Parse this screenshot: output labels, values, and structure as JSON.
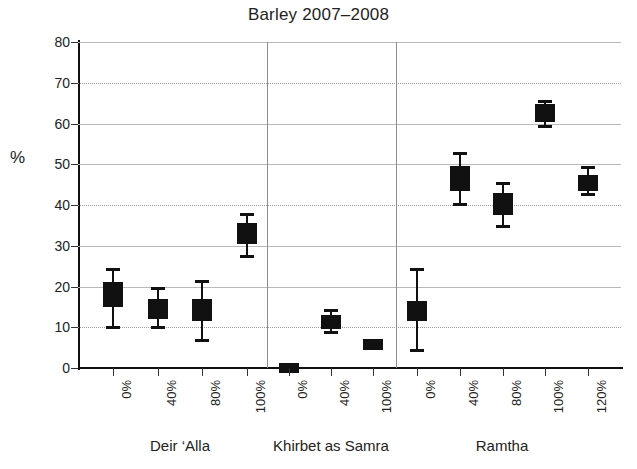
{
  "chart_data": {
    "type": "scatter",
    "title": "Barley 2007–2008",
    "xlabel": "",
    "ylabel": "%",
    "ylim": [
      0,
      80
    ],
    "ytick_step": 10,
    "yticks": [
      "80",
      "70",
      "60",
      "50",
      "40",
      "30",
      "20",
      "10",
      "0"
    ],
    "grid": true,
    "legend": "none",
    "groups": [
      {
        "name": "Deir ‘Alla",
        "categories": [
          "0%",
          "40%",
          "80%",
          "100%"
        ]
      },
      {
        "name": "Khirbet as Samra",
        "categories": [
          "0%",
          "40%",
          "100%"
        ]
      },
      {
        "name": "Ramtha",
        "categories": [
          "0%",
          "40%",
          "80%",
          "100%",
          "120%"
        ]
      }
    ],
    "categories": [
      "0%",
      "40%",
      "80%",
      "100%",
      "0%",
      "40%",
      "100%",
      "0%",
      "40%",
      "80%",
      "100%",
      "120%"
    ],
    "series": [
      {
        "name": "Barley",
        "points": [
          {
            "group": "Deir ‘Alla",
            "category": "0%",
            "value": 18.0,
            "box_low": 15.0,
            "box_high": 21.0,
            "whisker_low": 9.5,
            "whisker_high": 24.5
          },
          {
            "group": "Deir ‘Alla",
            "category": "40%",
            "value": 14.5,
            "box_low": 12.0,
            "box_high": 17.0,
            "whisker_low": 9.5,
            "whisker_high": 20.0
          },
          {
            "group": "Deir ‘Alla",
            "category": "80%",
            "value": 14.5,
            "box_low": 11.5,
            "box_high": 17.0,
            "whisker_low": 6.5,
            "whisker_high": 21.5
          },
          {
            "group": "Deir ‘Alla",
            "category": "100%",
            "value": 32.5,
            "box_low": 30.5,
            "box_high": 35.5,
            "whisker_low": 27.0,
            "whisker_high": 38.0
          },
          {
            "group": "Khirbet as Samra",
            "category": "0%",
            "value": 0.0,
            "box_low": -1.2,
            "box_high": 1.2,
            "whisker_low": -1.2,
            "whisker_high": 1.2
          },
          {
            "group": "Khirbet as Samra",
            "category": "40%",
            "value": 11.2,
            "box_low": 9.5,
            "box_high": 13.0,
            "whisker_low": 8.3,
            "whisker_high": 14.5
          },
          {
            "group": "Khirbet as Samra",
            "category": "100%",
            "value": 5.6,
            "box_low": 4.3,
            "box_high": 7.0,
            "whisker_low": 4.3,
            "whisker_high": 7.0
          },
          {
            "group": "Ramtha",
            "category": "0%",
            "value": 14.2,
            "box_low": 11.5,
            "box_high": 16.5,
            "whisker_low": 3.9,
            "whisker_high": 24.5
          },
          {
            "group": "Ramtha",
            "category": "40%",
            "value": 46.5,
            "box_low": 43.5,
            "box_high": 49.5,
            "whisker_low": 39.8,
            "whisker_high": 53.0
          },
          {
            "group": "Ramtha",
            "category": "80%",
            "value": 40.2,
            "box_low": 37.5,
            "box_high": 43.0,
            "whisker_low": 34.3,
            "whisker_high": 45.6
          },
          {
            "group": "Ramtha",
            "category": "100%",
            "value": 62.7,
            "box_low": 60.3,
            "box_high": 64.8,
            "whisker_low": 58.8,
            "whisker_high": 65.8
          },
          {
            "group": "Ramtha",
            "category": "120%",
            "value": 45.2,
            "box_low": 43.4,
            "box_high": 47.4,
            "whisker_low": 42.2,
            "whisker_high": 49.5
          }
        ]
      }
    ],
    "colors": {
      "marker": "#111111",
      "grid": "#b9b9b9",
      "axis": "#111111",
      "background": "#ffffff"
    }
  }
}
